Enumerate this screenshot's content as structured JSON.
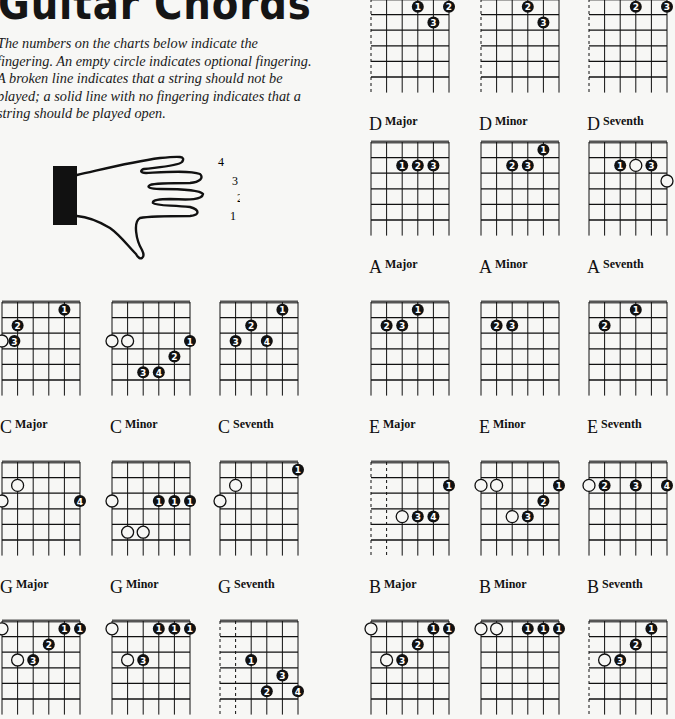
{
  "page": {
    "title": "Guitar Chords",
    "intro_lines": [
      "The numbers on the charts below indicate the",
      "fingering. An empty circle indicates optional fingering.",
      "A broken line indicates that a string should not be",
      "played; a solid line with no fingering indicates that a",
      "string should be played open."
    ],
    "hand_finger_labels": [
      "4",
      "3",
      "2",
      "1"
    ]
  },
  "colors": {
    "ink": "#111111",
    "nut": "#555555",
    "paper": "#f7f7f5"
  },
  "chart_layout": {
    "string_spacing": 15.6,
    "fret_spacing": 15.6,
    "frets": 5
  },
  "chords": [
    {
      "id": "c-major",
      "root": "C",
      "quality": "Major",
      "x": 2,
      "y": 302,
      "muted": [],
      "dots": [
        {
          "s": 4,
          "f": 1,
          "t": "1"
        },
        {
          "s": 1,
          "f": 2,
          "t": "2"
        },
        {
          "s": 0,
          "f": 3,
          "t": "o"
        },
        {
          "s": 0.6,
          "f": 3,
          "t": "3",
          "nudge": true
        }
      ]
    },
    {
      "id": "c-minor",
      "root": "C",
      "quality": "Minor",
      "x": 112,
      "y": 302,
      "muted": [],
      "dots": [
        {
          "s": 0,
          "f": 3,
          "t": "o"
        },
        {
          "s": 1,
          "f": 3,
          "t": "o"
        },
        {
          "s": 5,
          "f": 3,
          "t": "1"
        },
        {
          "s": 4,
          "f": 4,
          "t": "2"
        },
        {
          "s": 2,
          "f": 5,
          "t": "3"
        },
        {
          "s": 3,
          "f": 5,
          "t": "4"
        }
      ]
    },
    {
      "id": "c-seventh",
      "root": "C",
      "quality": "Seventh",
      "x": 220,
      "y": 302,
      "muted": [],
      "dots": [
        {
          "s": 4,
          "f": 1,
          "t": "1"
        },
        {
          "s": 2,
          "f": 2,
          "t": "2"
        },
        {
          "s": 1,
          "f": 3,
          "t": "3"
        },
        {
          "s": 3,
          "f": 3,
          "t": "4"
        }
      ]
    },
    {
      "id": "g-major",
      "root": "G",
      "quality": "Major",
      "x": 2,
      "y": 462,
      "muted": [],
      "dots": [
        {
          "s": 1,
          "f": 2,
          "t": "o"
        },
        {
          "s": 0,
          "f": 3,
          "t": "o"
        },
        {
          "s": 5,
          "f": 3,
          "t": "4"
        }
      ]
    },
    {
      "id": "g-minor",
      "root": "G",
      "quality": "Minor",
      "x": 112,
      "y": 462,
      "muted": [],
      "dots": [
        {
          "s": 0,
          "f": 3,
          "t": "o"
        },
        {
          "s": 3,
          "f": 3,
          "t": "1"
        },
        {
          "s": 4,
          "f": 3,
          "t": "1"
        },
        {
          "s": 5,
          "f": 3,
          "t": "1"
        },
        {
          "s": 1,
          "f": 5,
          "t": "o"
        },
        {
          "s": 2,
          "f": 5,
          "t": "o"
        }
      ]
    },
    {
      "id": "g-seventh",
      "root": "G",
      "quality": "Seventh",
      "x": 220,
      "y": 462,
      "muted": [],
      "dots": [
        {
          "s": 5,
          "f": 1,
          "t": "1"
        },
        {
          "s": 1,
          "f": 2,
          "t": "o"
        },
        {
          "s": 0,
          "f": 3,
          "t": "o"
        }
      ]
    },
    {
      "id": "f-major",
      "root": "",
      "quality": "",
      "x": 2,
      "y": 621,
      "muted": [],
      "dots": [
        {
          "s": 0,
          "f": 1,
          "t": "o"
        },
        {
          "s": 4,
          "f": 1,
          "t": "1"
        },
        {
          "s": 5,
          "f": 1,
          "t": "1"
        },
        {
          "s": 3,
          "f": 2,
          "t": "2"
        },
        {
          "s": 1,
          "f": 3,
          "t": "o"
        },
        {
          "s": 2,
          "f": 3,
          "t": "3"
        }
      ]
    },
    {
      "id": "f-minor",
      "root": "",
      "quality": "",
      "x": 112,
      "y": 621,
      "muted": [],
      "dots": [
        {
          "s": 0,
          "f": 1,
          "t": "o"
        },
        {
          "s": 3,
          "f": 1,
          "t": "1"
        },
        {
          "s": 4,
          "f": 1,
          "t": "1"
        },
        {
          "s": 5,
          "f": 1,
          "t": "1"
        },
        {
          "s": 1,
          "f": 3,
          "t": "o"
        },
        {
          "s": 2,
          "f": 3,
          "t": "3"
        }
      ]
    },
    {
      "id": "f-seventh",
      "root": "",
      "quality": "",
      "x": 220,
      "y": 621,
      "muted": [
        0,
        1
      ],
      "dots": [
        {
          "s": 2,
          "f": 3,
          "t": "1"
        },
        {
          "s": 4,
          "f": 4,
          "t": "3"
        },
        {
          "s": 3,
          "f": 5,
          "t": "2"
        },
        {
          "s": 5,
          "f": 5,
          "t": "4"
        }
      ]
    },
    {
      "id": "d-major",
      "root": "D",
      "quality": "Major",
      "x": 371,
      "y": -1,
      "muted": [
        0
      ],
      "dots": [
        {
          "s": 3,
          "f": 1,
          "t": "1"
        },
        {
          "s": 5,
          "f": 1,
          "t": "2"
        },
        {
          "s": 4,
          "f": 2,
          "t": "3"
        }
      ]
    },
    {
      "id": "d-minor",
      "root": "D",
      "quality": "Minor",
      "x": 481,
      "y": -1,
      "muted": [
        0
      ],
      "dots": [
        {
          "s": 3,
          "f": 1,
          "t": "2"
        },
        {
          "s": 4,
          "f": 2,
          "t": "3"
        }
      ]
    },
    {
      "id": "d-seventh",
      "root": "D",
      "quality": "Seventh",
      "x": 589,
      "y": -1,
      "muted": [
        0
      ],
      "dots": [
        {
          "s": 3,
          "f": 1,
          "t": "2"
        },
        {
          "s": 5,
          "f": 1,
          "t": "3"
        }
      ]
    },
    {
      "id": "a-major",
      "root": "A",
      "quality": "Major",
      "x": 371,
      "y": 142,
      "muted": [],
      "dots": [
        {
          "s": 2,
          "f": 2,
          "t": "1"
        },
        {
          "s": 3,
          "f": 2,
          "t": "2"
        },
        {
          "s": 4,
          "f": 2,
          "t": "3"
        }
      ]
    },
    {
      "id": "a-minor",
      "root": "A",
      "quality": "Minor",
      "x": 481,
      "y": 142,
      "muted": [],
      "dots": [
        {
          "s": 4,
          "f": 1,
          "t": "1"
        },
        {
          "s": 2,
          "f": 2,
          "t": "2"
        },
        {
          "s": 3,
          "f": 2,
          "t": "3"
        }
      ]
    },
    {
      "id": "a-seventh",
      "root": "A",
      "quality": "Seventh",
      "x": 589,
      "y": 142,
      "muted": [],
      "dots": [
        {
          "s": 2,
          "f": 2,
          "t": "1"
        },
        {
          "s": 3,
          "f": 2,
          "t": "o"
        },
        {
          "s": 4,
          "f": 2,
          "t": "3"
        },
        {
          "s": 5,
          "f": 3,
          "t": "o"
        }
      ]
    },
    {
      "id": "e-major",
      "root": "E",
      "quality": "Major",
      "x": 371,
      "y": 302,
      "muted": [],
      "dots": [
        {
          "s": 3,
          "f": 1,
          "t": "1"
        },
        {
          "s": 1,
          "f": 2,
          "t": "2"
        },
        {
          "s": 2,
          "f": 2,
          "t": "3"
        }
      ]
    },
    {
      "id": "e-minor",
      "root": "E",
      "quality": "Minor",
      "x": 481,
      "y": 302,
      "muted": [],
      "dots": [
        {
          "s": 1,
          "f": 2,
          "t": "2"
        },
        {
          "s": 2,
          "f": 2,
          "t": "3"
        }
      ]
    },
    {
      "id": "e-seventh",
      "root": "E",
      "quality": "Seventh",
      "x": 589,
      "y": 302,
      "muted": [],
      "dots": [
        {
          "s": 3,
          "f": 1,
          "t": "1"
        },
        {
          "s": 1,
          "f": 2,
          "t": "2"
        }
      ]
    },
    {
      "id": "b-major",
      "root": "B",
      "quality": "Major",
      "x": 371,
      "y": 462,
      "muted": [
        0,
        1
      ],
      "dots": [
        {
          "s": 5,
          "f": 2,
          "t": "1"
        },
        {
          "s": 2,
          "f": 4,
          "t": "o"
        },
        {
          "s": 3,
          "f": 4,
          "t": "3"
        },
        {
          "s": 4,
          "f": 4,
          "t": "4"
        }
      ]
    },
    {
      "id": "b-minor",
      "root": "B",
      "quality": "Minor",
      "x": 481,
      "y": 462,
      "muted": [],
      "dots": [
        {
          "s": 0,
          "f": 2,
          "t": "o"
        },
        {
          "s": 1,
          "f": 2,
          "t": "o"
        },
        {
          "s": 5,
          "f": 2,
          "t": "1"
        },
        {
          "s": 4,
          "f": 3,
          "t": "2"
        },
        {
          "s": 2,
          "f": 4,
          "t": "o"
        },
        {
          "s": 3,
          "f": 4,
          "t": "3"
        }
      ]
    },
    {
      "id": "b-seventh",
      "root": "B",
      "quality": "Seventh",
      "x": 589,
      "y": 462,
      "muted": [],
      "dots": [
        {
          "s": 0,
          "f": 2,
          "t": "o"
        },
        {
          "s": 1,
          "f": 2,
          "t": "2"
        },
        {
          "s": 3,
          "f": 2,
          "t": "3"
        },
        {
          "s": 5,
          "f": 2,
          "t": "4"
        }
      ]
    },
    {
      "id": "f2-major",
      "root": "",
      "quality": "",
      "x": 371,
      "y": 621,
      "muted": [],
      "dots": [
        {
          "s": 0,
          "f": 1,
          "t": "o"
        },
        {
          "s": 4,
          "f": 1,
          "t": "1"
        },
        {
          "s": 5,
          "f": 1,
          "t": "1"
        },
        {
          "s": 3,
          "f": 2,
          "t": "2"
        },
        {
          "s": 1,
          "f": 3,
          "t": "o"
        },
        {
          "s": 2,
          "f": 3,
          "t": "3"
        }
      ]
    },
    {
      "id": "f2-minor",
      "root": "",
      "quality": "",
      "x": 481,
      "y": 621,
      "muted": [],
      "dots": [
        {
          "s": 0,
          "f": 1,
          "t": "o"
        },
        {
          "s": 1,
          "f": 1,
          "t": "o"
        },
        {
          "s": 3,
          "f": 1,
          "t": "1"
        },
        {
          "s": 4,
          "f": 1,
          "t": "1"
        },
        {
          "s": 5,
          "f": 1,
          "t": "1"
        }
      ]
    },
    {
      "id": "f2-seventh",
      "root": "",
      "quality": "",
      "x": 589,
      "y": 621,
      "muted": [
        0
      ],
      "dots": [
        {
          "s": 4,
          "f": 1,
          "t": "1"
        },
        {
          "s": 3,
          "f": 2,
          "t": "2"
        },
        {
          "s": 1,
          "f": 3,
          "t": "o"
        },
        {
          "s": 2,
          "f": 3,
          "t": "3"
        }
      ]
    }
  ]
}
